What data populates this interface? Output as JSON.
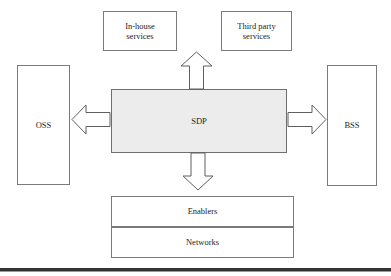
{
  "diagram": {
    "colors": {
      "center_fill": "#ececec",
      "box_fill": "#ffffff",
      "box_stroke": "#7a7a7a",
      "arrow_stroke": "#5f5f5f",
      "rule": "#333333",
      "text": "#1c1c1c"
    },
    "nodes": {
      "inhouse": {
        "label": "In-house\nservices",
        "line1": "In-house",
        "line2": "services"
      },
      "thirdparty": {
        "label": "Third party\nservices",
        "line1": "Third party",
        "line2": "services"
      },
      "oss": {
        "label": "OSS"
      },
      "bss": {
        "label": "BSS"
      },
      "sdp": {
        "label": "SDP"
      },
      "enablers": {
        "label": "Enablers"
      },
      "networks": {
        "label": "Networks"
      }
    },
    "arrows": [
      {
        "name": "arrow-up",
        "direction": "up",
        "from": "sdp",
        "to": "services"
      },
      {
        "name": "arrow-down",
        "direction": "down",
        "from": "sdp",
        "to": "enablers"
      },
      {
        "name": "arrow-left",
        "direction": "left",
        "from": "sdp",
        "to": "oss"
      },
      {
        "name": "arrow-right",
        "direction": "right",
        "from": "sdp",
        "to": "bss"
      }
    ]
  }
}
